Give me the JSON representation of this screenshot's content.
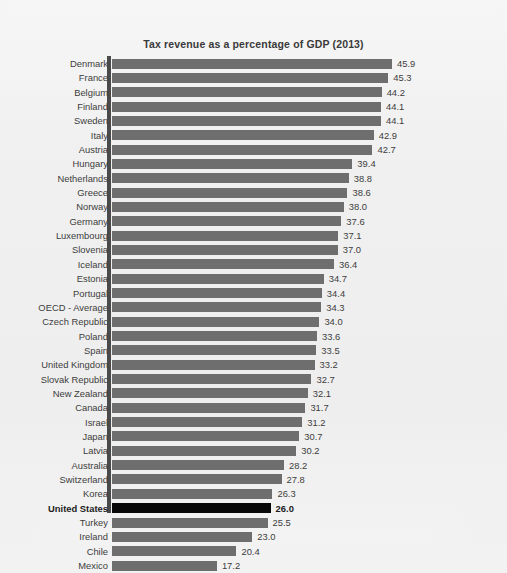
{
  "chart_data": {
    "type": "bar",
    "orientation": "horizontal",
    "title": "Tax revenue as a percentage of GDP (2013)",
    "xlabel": "",
    "ylabel": "",
    "xlim": [
      0,
      45.9
    ],
    "grid": false,
    "legend": null,
    "value_format": "one-decimal",
    "highlight_category": "United States",
    "colors": {
      "bar": "#6e6e6e",
      "bar_highlight": "#080808",
      "axis": "#4a4a4a",
      "text": "#3d3d3d",
      "title": "#3a3a3a",
      "background": "#f1f1f1"
    },
    "categories": [
      "Denmark",
      "France",
      "Belgium",
      "Finland",
      "Sweden",
      "Italy",
      "Austria",
      "Hungary",
      "Netherlands",
      "Greece",
      "Norway",
      "Germany",
      "Luxembourg",
      "Slovenia",
      "Iceland",
      "Estonia",
      "Portugal",
      "OECD - Average",
      "Czech Republic",
      "Poland",
      "Spain",
      "United Kingdom",
      "Slovak Republic",
      "New Zealand",
      "Canada",
      "Israel",
      "Japan",
      "Latvia",
      "Australia",
      "Switzerland",
      "Korea",
      "United States",
      "Turkey",
      "Ireland",
      "Chile",
      "Mexico"
    ],
    "values": [
      45.9,
      45.3,
      44.2,
      44.1,
      44.1,
      42.9,
      42.7,
      39.4,
      38.8,
      38.6,
      38.0,
      37.6,
      37.1,
      37.0,
      36.4,
      34.7,
      34.4,
      34.3,
      34.0,
      33.6,
      33.5,
      33.2,
      32.7,
      32.1,
      31.7,
      31.2,
      30.7,
      30.2,
      28.2,
      27.8,
      26.3,
      26.0,
      25.5,
      23.0,
      20.4,
      17.2
    ],
    "value_labels": [
      "45.9",
      "45.3",
      "44.2",
      "44.1",
      "44.1",
      "42.9",
      "42.7",
      "39.4",
      "38.8",
      "38.6",
      "38.0",
      "37.6",
      "37.1",
      "37.0",
      "36.4",
      "34.7",
      "34.4",
      "34.3",
      "34.0",
      "33.6",
      "33.5",
      "33.2",
      "32.7",
      "32.1",
      "31.7",
      "31.2",
      "30.7",
      "30.2",
      "28.2",
      "27.8",
      "26.3",
      "26.0",
      "25.5",
      "23.0",
      "20.4",
      "17.2"
    ]
  }
}
